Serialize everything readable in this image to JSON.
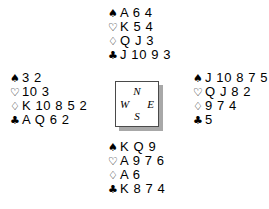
{
  "diagram": {
    "type": "bridge-deal-diagram",
    "background_color": "#ffffff",
    "text_color": "#000000"
  },
  "suits": {
    "spade": {
      "name": "spade-suit-symbol",
      "glyph": "♠",
      "style": "solid"
    },
    "heart": {
      "name": "heart-suit-symbol",
      "glyph": "♡",
      "style": "hollow"
    },
    "diamond": {
      "name": "diamond-suit-symbol",
      "glyph": "♢",
      "style": "hollow"
    },
    "club": {
      "name": "club-suit-symbol",
      "glyph": "♣",
      "style": "solid"
    }
  },
  "hands": {
    "north": {
      "label": "North",
      "spades": "A 6 4",
      "hearts": "K 5 4",
      "diamonds": "Q J 3",
      "clubs": "J 10 9 3"
    },
    "west": {
      "label": "West",
      "spades": "3 2",
      "hearts": "10 3",
      "diamonds": "K 10 8 5 2",
      "clubs": "A Q 6 2"
    },
    "east": {
      "label": "East",
      "spades": "J 10 8 7 5",
      "hearts": "Q J 8 2",
      "diamonds": "9 7 4",
      "clubs": "5"
    },
    "south": {
      "label": "South",
      "spades": "K Q 9",
      "hearts": "A 9 7 6",
      "diamonds": "A 6",
      "clubs": "K 8 7 4"
    }
  },
  "compass": {
    "north": "N",
    "west": "W",
    "east": "E",
    "south": "S",
    "border_color": "#4a4a4a",
    "shadow_color": "#a8a8a8"
  }
}
